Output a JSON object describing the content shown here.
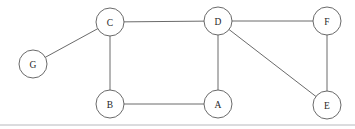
{
  "figure": {
    "type": "undirected-graph-diagram",
    "width": 355,
    "height": 129,
    "background_color": "#ffffff",
    "stroke_color": "#595959",
    "label_color": "#262626",
    "node_radius": 14,
    "footer_rule": {
      "visible": true,
      "y": 125,
      "x_start": 0,
      "x_end": 355,
      "color": "#b8b8bd"
    }
  },
  "nodes": [
    {
      "id": "G",
      "label": "G",
      "cx": 33,
      "cy": 64
    },
    {
      "id": "C",
      "label": "C",
      "cx": 110,
      "cy": 22
    },
    {
      "id": "D",
      "label": "D",
      "cx": 218,
      "cy": 21
    },
    {
      "id": "F",
      "label": "F",
      "cx": 327,
      "cy": 21
    },
    {
      "id": "B",
      "label": "B",
      "cx": 110,
      "cy": 104
    },
    {
      "id": "A",
      "label": "A",
      "cx": 218,
      "cy": 104
    },
    {
      "id": "E",
      "label": "E",
      "cx": 327,
      "cy": 105
    }
  ],
  "edges": [
    {
      "id": "G-C",
      "from": "G",
      "to": "C"
    },
    {
      "id": "C-D",
      "from": "C",
      "to": "D"
    },
    {
      "id": "C-B",
      "from": "C",
      "to": "B"
    },
    {
      "id": "D-F",
      "from": "D",
      "to": "F"
    },
    {
      "id": "D-A",
      "from": "D",
      "to": "A"
    },
    {
      "id": "D-E",
      "from": "D",
      "to": "E"
    },
    {
      "id": "B-A",
      "from": "B",
      "to": "A"
    },
    {
      "id": "F-E",
      "from": "F",
      "to": "E"
    }
  ]
}
